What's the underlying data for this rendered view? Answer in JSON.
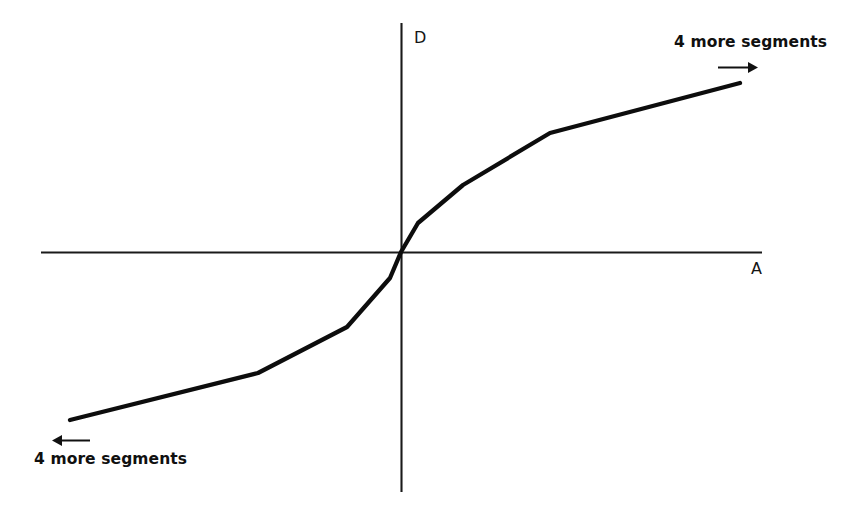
{
  "figure": {
    "name": "piecewise-linear-companding-characteristic",
    "background_color": "#ffffff",
    "line_color": "#0d0d0d",
    "axis_color": "#1a1a1a"
  },
  "axes": {
    "vertical_label": "D",
    "horizontal_label": "A",
    "origin_px": [
      401,
      252
    ],
    "horizontal_extent_px": [
      41,
      762
    ],
    "vertical_extent_px": [
      23,
      492
    ]
  },
  "annotations": [
    {
      "id": "top-right",
      "text": "4 more segments",
      "arrow_direction": "right",
      "arrow_from_px": [
        718,
        67
      ],
      "arrow_to_px": [
        757,
        67
      ]
    },
    {
      "id": "bottom-left",
      "text": "4 more segments",
      "arrow_direction": "left",
      "arrow_from_px": [
        89,
        440
      ],
      "arrow_to_px": [
        51,
        440
      ]
    }
  ],
  "chart_data": {
    "type": "line",
    "title": "",
    "subtitle": "",
    "xlabel": "A",
    "ylabel": "D",
    "legend": [],
    "legend_position": "none",
    "grid": false,
    "axis_style": "centered-cross-through-origin",
    "xlim": [
      -1,
      1
    ],
    "ylim": [
      -1,
      1
    ],
    "series": [
      {
        "name": "compression characteristic",
        "x": [
          -0.918,
          -0.397,
          -0.15,
          -0.0305,
          0,
          0.0472,
          0.172,
          0.413,
          0.94
        ],
        "y": [
          -0.732,
          -0.516,
          -0.32,
          -0.111,
          0,
          0.124,
          0.286,
          0.507,
          0.721
        ]
      }
    ],
    "breakpoints_px": [
      [
        70,
        420
      ],
      [
        258,
        373
      ],
      [
        347,
        327
      ],
      [
        390,
        278
      ],
      [
        401,
        252
      ],
      [
        418,
        223
      ],
      [
        463,
        185
      ],
      [
        550,
        133
      ],
      [
        740,
        83
      ]
    ],
    "segment_count_visible": 9,
    "segments_beyond_each_end": 4
  }
}
